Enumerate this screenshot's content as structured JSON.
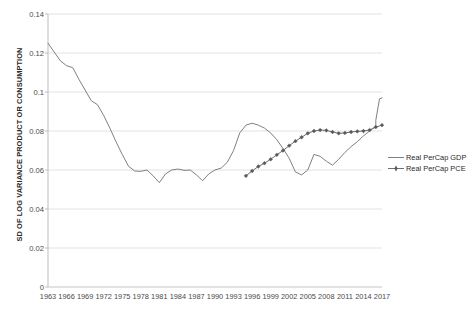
{
  "chart_data": {
    "type": "line",
    "title": "",
    "xlabel": "",
    "ylabel": "SD OF LOG VARIANCE PRODUCT OR CONSUMPTION",
    "ylim": [
      0,
      0.14
    ],
    "ytick_labels": [
      "0",
      "0.02",
      "0.04",
      "0.06",
      "0.08",
      "0.1",
      "0.12",
      "0.14"
    ],
    "ytick_values": [
      0,
      0.02,
      0.04,
      0.06,
      0.08,
      0.1,
      0.12,
      0.14
    ],
    "xlim": [
      1963,
      2017
    ],
    "xtick_labels": [
      "1963",
      "1966",
      "1969",
      "1972",
      "1975",
      "1978",
      "1981",
      "1984",
      "1987",
      "1990",
      "1993",
      "1996",
      "1999",
      "2002",
      "2005",
      "2008",
      "2011",
      "2014",
      "2017"
    ],
    "xtick_values": [
      1963,
      1966,
      1969,
      1972,
      1975,
      1978,
      1981,
      1984,
      1987,
      1990,
      1993,
      1996,
      1999,
      2002,
      2005,
      2008,
      2011,
      2014,
      2017
    ],
    "grid": "horizontal",
    "legend_position": "right",
    "series": [
      {
        "name": "Real PerCap GDP",
        "marker": "none",
        "color": "#808080",
        "x": [
          1963,
          1964,
          1965,
          1966,
          1967,
          1968,
          1969,
          1970,
          1971,
          1972,
          1973,
          1974,
          1975,
          1976,
          1977,
          1978,
          1979,
          1980,
          1981,
          1982,
          1983,
          1984,
          1985,
          1986,
          1987,
          1988,
          1989,
          1990,
          1991,
          1992,
          1993,
          1994,
          1995,
          1996,
          1997,
          1998,
          1999,
          2000,
          2001,
          2002,
          2003,
          2004,
          2005,
          2006,
          2007,
          2008,
          2009,
          2010,
          2011,
          2012,
          2013,
          2014,
          2015,
          2016,
          2017
        ],
        "values": [
          0.125,
          0.1205,
          0.116,
          0.1135,
          0.1125,
          0.1065,
          0.101,
          0.0955,
          0.0935,
          0.088,
          0.0815,
          0.0745,
          0.068,
          0.062,
          0.0595,
          0.0593,
          0.06,
          0.057,
          0.0535,
          0.058,
          0.06,
          0.0605,
          0.0598,
          0.06,
          0.0575,
          0.0545,
          0.058,
          0.06,
          0.061,
          0.064,
          0.07,
          0.079,
          0.083,
          0.084,
          0.083,
          0.0815,
          0.079,
          0.0755,
          0.071,
          0.066,
          0.059,
          0.0575,
          0.06,
          0.068,
          0.067,
          0.0645,
          0.0625,
          0.0655,
          0.069,
          0.072,
          0.0745,
          0.0775,
          0.08,
          0.0825,
          0.0845
        ],
        "note_tail": "rises sharply to about 0.097 at 2017"
      },
      {
        "name": "Real PerCap PCE",
        "marker": "plus-diamond",
        "color": "#6e6e6e",
        "x": [
          1995,
          1996,
          1997,
          1998,
          1999,
          2000,
          2001,
          2002,
          2003,
          2004,
          2005,
          2006,
          2007,
          2008,
          2009,
          2010,
          2011,
          2012,
          2013,
          2014,
          2015,
          2016,
          2017
        ],
        "values": [
          0.057,
          0.0595,
          0.0618,
          0.0635,
          0.0655,
          0.0678,
          0.07,
          0.0725,
          0.0748,
          0.0768,
          0.0788,
          0.08,
          0.0805,
          0.0803,
          0.0795,
          0.0788,
          0.079,
          0.0795,
          0.0798,
          0.08,
          0.0805,
          0.082,
          0.083
        ]
      }
    ]
  },
  "legend": {
    "items": [
      {
        "label": "Real PerCap GDP",
        "marker": "line"
      },
      {
        "label": "Real PerCap PCE",
        "marker": "line-with-marker"
      }
    ]
  }
}
